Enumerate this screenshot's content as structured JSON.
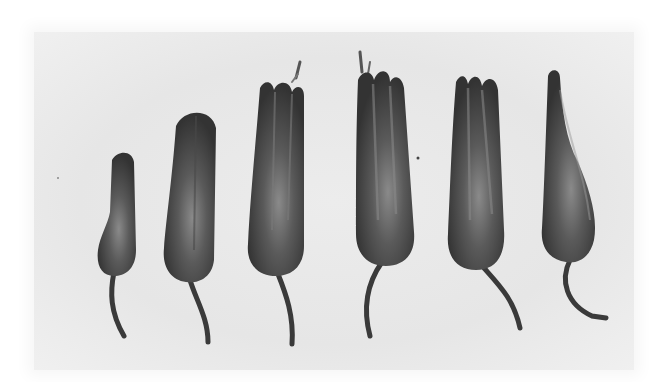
{
  "image": {
    "description": "Grayscale halftone photograph of six flower buds arranged left to right in progressive stages of development, from a small closed bud to a fully opened/withered flower, each with a curved stalk.",
    "colors": {
      "page": "#ffffff",
      "backdrop": "#e8e8e8",
      "bud_dark": "#3a3a3a",
      "bud_mid": "#555555",
      "bud_highlight": "#8a8a8a"
    },
    "buds": [
      {
        "id": 1,
        "stage": "small closed bud"
      },
      {
        "id": 2,
        "stage": "larger closed bud"
      },
      {
        "id": 3,
        "stage": "opening, petal tips separating, stamens visible"
      },
      {
        "id": 4,
        "stage": "open, tallest, stamens protruding"
      },
      {
        "id": 5,
        "stage": "open, petal tips separated"
      },
      {
        "id": 6,
        "stage": "withered, twisted tip"
      }
    ]
  }
}
